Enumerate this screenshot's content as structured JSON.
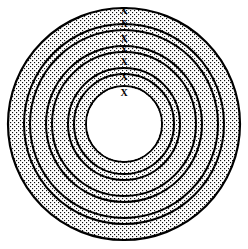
{
  "figure": {
    "type": "line-art-diagram",
    "canvas": {
      "width": 248,
      "height": 249,
      "background": "#ffffff"
    },
    "center": {
      "cx": 124,
      "cy": 124
    },
    "stroke_color": "#000000",
    "stipple_color": "#000000",
    "stipple_fill_label": "dotted-stipple",
    "outline_width_px": 2.2,
    "inner_outline_width_px": 1.8
  },
  "rings": [
    {
      "name": "band-1-outer",
      "outer_r": 116,
      "inner_r": 100,
      "fill": "stipple",
      "label": "X"
    },
    {
      "name": "gap-1",
      "outer_r": 100,
      "inner_r": 94,
      "fill": "white",
      "label": "X"
    },
    {
      "name": "band-2",
      "outer_r": 94,
      "inner_r": 78,
      "fill": "stipple",
      "label": "X"
    },
    {
      "name": "gap-2",
      "outer_r": 78,
      "inner_r": 72,
      "fill": "white",
      "label": "X"
    },
    {
      "name": "band-3",
      "outer_r": 72,
      "inner_r": 56,
      "fill": "stipple",
      "label": "X"
    },
    {
      "name": "gap-3",
      "outer_r": 56,
      "inner_r": 50,
      "fill": "white",
      "label": "X"
    },
    {
      "name": "band-4-inner",
      "outer_r": 50,
      "inner_r": 38,
      "fill": "stipple",
      "label": "X"
    },
    {
      "name": "core",
      "outer_r": 38,
      "inner_r": 0,
      "fill": "white",
      "label": "X"
    }
  ],
  "x_labels": [
    {
      "name": "x-label-1",
      "text": "X",
      "x": 124,
      "y": 10,
      "size": 11
    },
    {
      "name": "x-label-2",
      "text": "X",
      "x": 124,
      "y": 24,
      "size": 10
    },
    {
      "name": "x-label-3",
      "text": "X",
      "x": 124,
      "y": 39,
      "size": 10
    },
    {
      "name": "x-label-4",
      "text": "X",
      "x": 124,
      "y": 50,
      "size": 10
    },
    {
      "name": "x-label-5",
      "text": "X",
      "x": 124,
      "y": 62,
      "size": 10
    },
    {
      "name": "x-label-6",
      "text": "X",
      "x": 124,
      "y": 77,
      "size": 10
    },
    {
      "name": "x-label-7",
      "text": "X",
      "x": 124,
      "y": 93,
      "size": 10
    }
  ]
}
